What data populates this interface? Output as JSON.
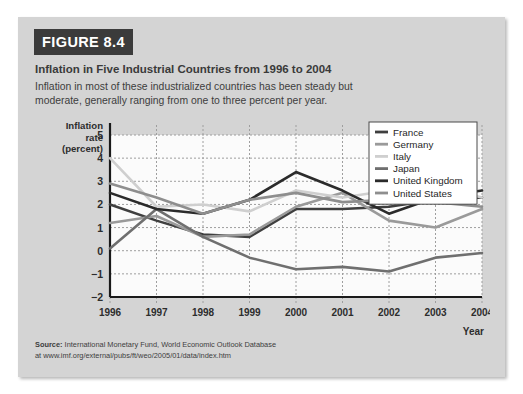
{
  "figure": {
    "badge": "FIGURE 8.4",
    "title": "Inflation in Five Industrial Countries from 1996 to 2004",
    "subtitle": "Inflation in most of these industrialized countries has been steady but moderate, generally ranging from one to three percent per year.",
    "source_label": "Source:",
    "source_text": "International Monetary Fund, World Economic Outlook Database",
    "source_url_line": "at www.imf.org/external/pubs/ft/weo/2005/01/data/index.htm"
  },
  "chart_data": {
    "type": "line",
    "title": "Inflation in Five Industrial Countries from 1996 to 2004",
    "xlabel": "Year",
    "ylabel": "Inflation rate (percent)",
    "ylabel_lines": [
      "Inflation",
      "rate",
      "(percent)"
    ],
    "x": [
      1996,
      1997,
      1998,
      1999,
      2000,
      2001,
      2002,
      2003,
      2004
    ],
    "xtick_labels": [
      "1996",
      "1997",
      "1998",
      "1999",
      "2000",
      "2001",
      "2002",
      "2003",
      "2004"
    ],
    "ylim": [
      -2,
      5
    ],
    "yticks": [
      5,
      4,
      3,
      2,
      1,
      0,
      -1,
      -2
    ],
    "ytick_labels": [
      "5",
      "4",
      "3",
      "2",
      "1",
      "0",
      "−1",
      "−2"
    ],
    "grid": true,
    "legend_position": "top-right",
    "series": [
      {
        "name": "France",
        "color": "#3f3f3f",
        "width": 2.6,
        "values": [
          2.0,
          1.3,
          0.7,
          0.6,
          1.8,
          1.8,
          1.9,
          2.2,
          2.3
        ]
      },
      {
        "name": "Germany",
        "color": "#9a9a9a",
        "width": 2.6,
        "values": [
          1.2,
          1.5,
          0.6,
          0.7,
          1.9,
          2.5,
          1.3,
          1.0,
          1.8
        ]
      },
      {
        "name": "Italy",
        "color": "#cfcfcf",
        "width": 2.6,
        "values": [
          4.0,
          1.9,
          2.0,
          1.7,
          2.6,
          2.3,
          2.6,
          2.8,
          2.3
        ]
      },
      {
        "name": "Japan",
        "color": "#6f6f6f",
        "width": 2.6,
        "values": [
          0.1,
          1.8,
          0.6,
          -0.3,
          -0.8,
          -0.7,
          -0.9,
          -0.3,
          -0.1
        ]
      },
      {
        "name": "United Kingdom",
        "color": "#2b2b2b",
        "width": 2.6,
        "values": [
          2.5,
          1.8,
          1.6,
          2.2,
          3.4,
          2.6,
          1.6,
          2.3,
          2.6
        ]
      },
      {
        "name": "United States",
        "color": "#8e8e8e",
        "width": 2.6,
        "values": [
          2.9,
          2.3,
          1.6,
          2.2,
          2.5,
          2.1,
          2.2,
          2.1,
          1.9
        ]
      }
    ]
  }
}
